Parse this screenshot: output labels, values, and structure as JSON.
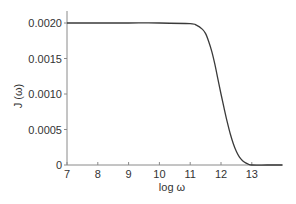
{
  "chart_data": {
    "type": "line",
    "title": "",
    "xlabel": "log ω",
    "ylabel": "J (ω)",
    "xlim": [
      7,
      14
    ],
    "ylim": [
      0,
      0.0021
    ],
    "grid": false,
    "legend": null,
    "x_ticks": [
      7,
      8,
      9,
      10,
      11,
      12,
      13
    ],
    "x_tick_labels": [
      "7",
      "8",
      "9",
      "10",
      "11",
      "12",
      "13"
    ],
    "y_ticks": [
      0,
      0.0005,
      0.001,
      0.0015,
      0.002
    ],
    "y_tick_labels": [
      "0",
      "0.0005",
      "0.0010",
      "0.0015",
      "0.0020"
    ],
    "series": [
      {
        "name": "J(ω)",
        "color": "#3a3a3a",
        "x": [
          7,
          8,
          9,
          10,
          11,
          11.2,
          11.4,
          11.5,
          11.6,
          11.7,
          11.8,
          11.9,
          12.0,
          12.1,
          12.2,
          12.3,
          12.4,
          12.5,
          12.6,
          12.7,
          12.8,
          12.9,
          13.0,
          13.5,
          14.0
        ],
        "y": [
          0.002,
          0.002,
          0.002,
          0.002,
          0.00199,
          0.00197,
          0.00191,
          0.00185,
          0.00174,
          0.0016,
          0.00142,
          0.00121,
          0.001,
          0.0008,
          0.00061,
          0.00044,
          0.0003,
          0.00019,
          0.00011,
          6e-05,
          3e-05,
          1e-05,
          0.0,
          0.0,
          0.0
        ]
      }
    ]
  },
  "axes": {
    "xlabel": "log ω",
    "ylabel": "J (ω)"
  }
}
